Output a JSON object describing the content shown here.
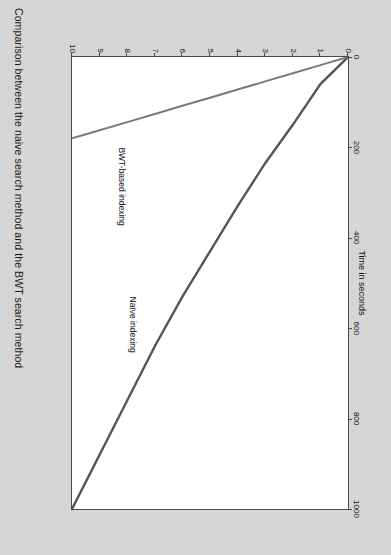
{
  "caption": "Comparison between the naive search method and the BWT search method",
  "figure": {
    "x_axis_title": "Time in seconds",
    "y_axis_title": "# of inserts (length ~ 1000)",
    "series_labels": {
      "bwt": "BWT-based indexing",
      "naive": "Naïve indexing"
    }
  },
  "colors": {
    "page_background": "#d6d6d6",
    "plot_background": "#ffffff",
    "axis": "#4a4a4a",
    "line": "#555555",
    "text": "#111111"
  },
  "chart_data": {
    "type": "line",
    "title": "Time in seconds",
    "xlabel": "Time in seconds",
    "ylabel": "# of inserts (length ~ 1000)",
    "orientation": "rotated-90-clockwise",
    "grid": false,
    "legend_position": "inline-annotations",
    "xlim": [
      0,
      1000
    ],
    "ylim": [
      0,
      10
    ],
    "xticks": [
      0,
      200,
      400,
      600,
      800,
      1000
    ],
    "xtick_labels": [
      "0",
      "200",
      "400",
      "600",
      "800",
      "1000"
    ],
    "yticks": [
      0,
      1,
      2,
      3,
      4,
      5,
      6,
      7,
      8,
      9,
      10
    ],
    "ytick_labels": [
      "0",
      "1",
      "2",
      "3",
      "4",
      "5",
      "6",
      "7",
      "8",
      "9",
      "10"
    ],
    "x": [
      0,
      1,
      2,
      3,
      4,
      5,
      6,
      7,
      8,
      9,
      10
    ],
    "series": [
      {
        "name": "Naïve indexing",
        "values": [
          0,
          60,
          150,
          235,
          330,
          430,
          530,
          640,
          760,
          880,
          1000
        ]
      },
      {
        "name": "BWT-based indexing",
        "values": [
          0,
          18,
          36,
          54,
          72,
          90,
          108,
          126,
          144,
          162,
          180
        ]
      }
    ]
  }
}
